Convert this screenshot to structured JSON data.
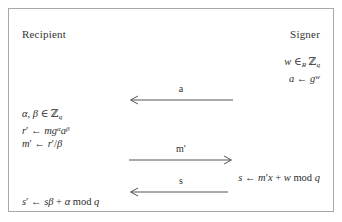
{
  "diagram": {
    "frame": {
      "border_color": "#a8a8a8",
      "background": "#ffffff"
    },
    "parties": {
      "left": "Recipient",
      "right": "Signer"
    },
    "steps": {
      "signer_init": {
        "lines": [
          "w ∈R ℤq",
          "a ← g^w"
        ]
      },
      "recipient_blind": {
        "lines": [
          "α, β ∈ ℤq",
          "r′ ← mg^α a^β",
          "m′ ← r′ / β"
        ]
      },
      "signer_sign": {
        "lines": [
          "s ← m′x + w mod q"
        ]
      },
      "recipient_unblind": {
        "lines": [
          "s′ ← sβ + α mod q"
        ]
      }
    },
    "messages": [
      {
        "label": "a",
        "direction": "left",
        "from": "Signer",
        "to": "Recipient"
      },
      {
        "label": "m′",
        "direction": "right",
        "from": "Recipient",
        "to": "Signer"
      },
      {
        "label": "s",
        "direction": "left",
        "from": "Signer",
        "to": "Recipient"
      }
    ],
    "colors": {
      "text": "#2e2e2e",
      "line": "#555555",
      "border": "#a8a8a8"
    }
  }
}
